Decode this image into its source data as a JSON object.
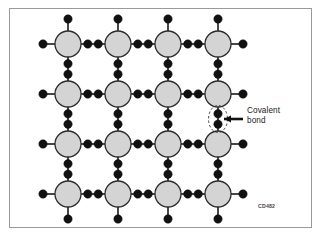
{
  "figure": {
    "type": "covalent-bonding-lattice-diagram",
    "width": 322,
    "height": 237,
    "background_color": "#ffffff",
    "border_color": "#9a9a9a",
    "code": "CD482"
  },
  "annotation": {
    "label_line1": "Covalent",
    "label_line2": "bond",
    "leader_arrow": "arrow-pointing-left",
    "highlight_shape": "dashed-ellipse"
  },
  "lattice": {
    "rows": 4,
    "cols": 4,
    "atom_fill": "#d4d4d4",
    "atom_stroke": "#2b2b2b",
    "atom_radius": 13,
    "electron_color": "#111111",
    "electron_radius": 4.2,
    "bond_line_color": "#1a1a1a",
    "origin_x": 68,
    "origin_y": 44,
    "spacing_x": 50,
    "spacing_y": 50,
    "atom_label": "atom-core",
    "electron_pair_label": "shared-electron-pair",
    "edge_electron_label": "edge-electron"
  },
  "chart_data": {
    "type": "diagram",
    "atom_grid": {
      "rows": 4,
      "cols": 4,
      "total_atoms": 16
    },
    "interior_bonds": {
      "horizontal": 12,
      "vertical": 12,
      "electrons_per_bond": 2
    },
    "perimeter_stubs": {
      "top": 4,
      "bottom": 4,
      "left": 4,
      "right": 4,
      "electrons_per_stub": 1
    },
    "highlighted_bond": {
      "orientation": "vertical",
      "between_atoms": [
        "row2-col4",
        "row3-col4"
      ],
      "label": "Covalent bond"
    }
  }
}
